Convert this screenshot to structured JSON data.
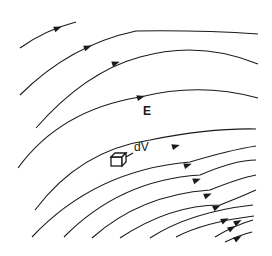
{
  "diagram": {
    "type": "electric-field-lines",
    "field_label": "E",
    "volume_label": "dV",
    "line_color": "#1a1a1a",
    "background": "#ffffff",
    "field_lines": [
      {
        "id": 1,
        "path": "M20,48 Q45,30 76,22",
        "arrow_at": [
          58,
          28
        ],
        "arrow_angle": -22
      },
      {
        "id": 2,
        "path": "M20,95 Q70,45 136,31 Q200,30 258,34",
        "arrow_at": [
          88,
          47
        ],
        "arrow_angle": -22
      },
      {
        "id": 3,
        "path": "M36,128 Q85,72 140,57 Q200,40 258,64",
        "arrow_at": [
          116,
          63
        ],
        "arrow_angle": -18
      },
      {
        "id": 4,
        "path": "M18,168 Q60,110 140,97 Q200,82 258,98",
        "arrow_at": [
          141,
          97
        ],
        "arrow_angle": -16
      },
      {
        "id": 5,
        "path": "M35,210 Q80,150 150,140 Q210,128 256,129",
        "arrow_at": [
          176,
          146
        ],
        "arrow_angle": -16
      },
      {
        "id": 6,
        "path": "M32,237 Q95,170 190,162 Q230,150 256,146",
        "arrow_at": [
          188,
          165
        ],
        "arrow_angle": -18
      },
      {
        "id": 7,
        "path": "M64,237 Q120,180 200,175 Q235,160 256,160",
        "arrow_at": [
          197,
          180
        ],
        "arrow_angle": -20
      },
      {
        "id": 8,
        "path": "M92,238 Q140,195 210,190 Q240,178 256,175",
        "arrow_at": [
          208,
          195
        ],
        "arrow_angle": -22
      },
      {
        "id": 9,
        "path": "M120,238 Q170,205 220,205 Q245,195 256,190",
        "arrow_at": [
          217,
          207
        ],
        "arrow_angle": -24
      },
      {
        "id": 10,
        "path": "M150,238 Q190,212 253,205",
        "arrow_at": [
          225,
          220
        ],
        "arrow_angle": -26
      },
      {
        "id": 11,
        "path": "M176,237 Q205,222 254,216",
        "arrow_at": [
          238,
          222
        ],
        "arrow_angle": -28
      },
      {
        "id": 12,
        "path": "M215,237 Q235,225 253,220",
        "arrow_at": [
          232,
          228
        ],
        "arrow_angle": -30
      },
      {
        "id": 13,
        "path": "M225,242 Q240,235 252,232",
        "arrow_at": [
          238,
          238
        ],
        "arrow_angle": -30
      }
    ]
  }
}
